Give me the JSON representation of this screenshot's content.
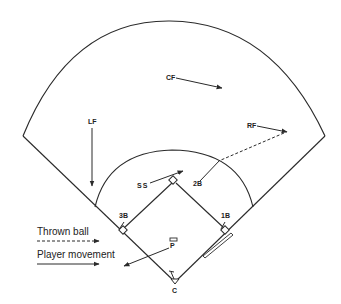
{
  "diagram": {
    "type": "baseball-field-defensive-play",
    "colors": {
      "line": "#2a2a2a",
      "background": "#ffffff",
      "text": "#222222"
    },
    "positions": [
      {
        "id": "CF",
        "label": "CF",
        "movement": "right-down toward right-center"
      },
      {
        "id": "LF",
        "label": "LF",
        "movement": "down toward infield"
      },
      {
        "id": "RF",
        "label": "RF",
        "movement": "right toward right foul line"
      },
      {
        "id": "SS",
        "label": "SS",
        "movement": "toward second base"
      },
      {
        "id": "2B",
        "label": "2B",
        "movement": "out toward right field to receive throw"
      },
      {
        "id": "3B",
        "label": "3B",
        "movement": "toward third base"
      },
      {
        "id": "1B",
        "label": "1B",
        "movement": "toward first base"
      },
      {
        "id": "P",
        "label": "P",
        "movement": "toward third base side"
      },
      {
        "id": "C",
        "label": "C",
        "movement": "stays at home"
      }
    ],
    "throws": [
      {
        "from": "RF",
        "to": "2B",
        "style": "dashed"
      }
    ],
    "legend": {
      "thrown_ball": "Thrown ball",
      "player_movement": "Player movement"
    }
  }
}
